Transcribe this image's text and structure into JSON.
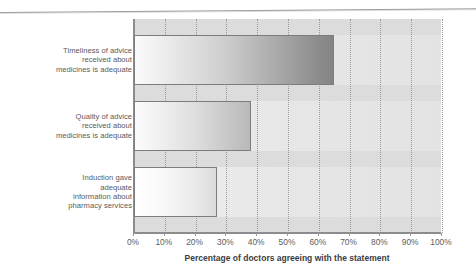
{
  "chart_data": {
    "type": "bar",
    "orientation": "horizontal",
    "title": "",
    "xlabel": "Percentage of doctors agreeing with the statement",
    "ylabel": "",
    "xlim": [
      0,
      100
    ],
    "xticks": [
      "0%",
      "10%",
      "20%",
      "30%",
      "40%",
      "50%",
      "60%",
      "70%",
      "80%",
      "90%",
      "100%"
    ],
    "xtick_values": [
      0,
      10,
      20,
      30,
      40,
      50,
      60,
      70,
      80,
      90,
      100
    ],
    "grid": "vertical-dotted",
    "legend": "none",
    "categories": [
      "Timeliness of advice received about medicines is adequate",
      "Quality of advice received about medicines is adequate",
      "Induction gave adequate information about pharmacy services"
    ],
    "category_lines": [
      [
        "Timeliness of advice",
        "received about",
        "medicines is adequate"
      ],
      [
        "Quality of advice",
        "received about",
        "medicines is adequate"
      ],
      [
        "Induction gave",
        "adequate",
        "information about",
        "pharmacy services"
      ]
    ],
    "values": [
      65,
      38,
      27
    ],
    "series": [
      {
        "name": "Percentage of doctors agreeing",
        "values": [
          65,
          38,
          27
        ]
      }
    ]
  },
  "axis": {
    "x_title": "Percentage of doctors agreeing with the statement",
    "ticks": [
      {
        "label": "0%",
        "value": 0
      },
      {
        "label": "10%",
        "value": 10
      },
      {
        "label": "20%",
        "value": 20
      },
      {
        "label": "30%",
        "value": 30
      },
      {
        "label": "40%",
        "value": 40
      },
      {
        "label": "50%",
        "value": 50
      },
      {
        "label": "60%",
        "value": 60
      },
      {
        "label": "70%",
        "value": 70
      },
      {
        "label": "80%",
        "value": 80
      },
      {
        "label": "90%",
        "value": 90
      },
      {
        "label": "100%",
        "value": 100
      }
    ]
  },
  "bars": [
    {
      "id": "bar-timeliness",
      "lines": [
        "Timeliness of advice",
        "received about",
        "medicines is adequate"
      ],
      "value": 65
    },
    {
      "id": "bar-quality",
      "lines": [
        "Quality of advice",
        "received about",
        "medicines is adequate"
      ],
      "value": 38
    },
    {
      "id": "bar-induction",
      "lines": [
        "Induction gave",
        "adequate",
        "information about",
        "pharmacy services"
      ],
      "value": 27
    }
  ],
  "colors": {
    "plot_background": "#e9e9e9",
    "band": "#dcdcdc",
    "gridline": "#9a9a9c",
    "axis": "#8c8c8e",
    "bar_border": "#7d7d7f",
    "label_text": "#59595b",
    "tick_text": "#5d5d5f",
    "title_text": "#3c3c3e"
  }
}
